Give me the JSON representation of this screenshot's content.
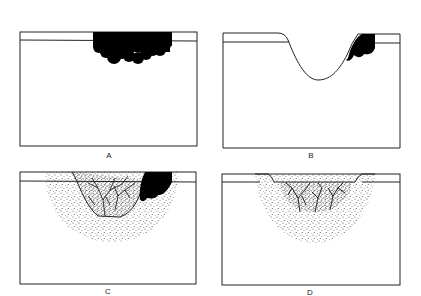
{
  "figure": {
    "panels": [
      {
        "id": "A",
        "label": "A",
        "description": "Flat surface layer with dark blob mass pressing into upper layer"
      },
      {
        "id": "B",
        "label": "B",
        "description": "Crater/depression in surface with dark mass on right slope"
      },
      {
        "id": "C",
        "label": "C",
        "description": "Depression with stippled halo, branching vessel network, dark mass on right"
      },
      {
        "id": "D",
        "label": "D",
        "description": "Shallow depression with stippled halo and branching vessel network"
      }
    ],
    "colors": {
      "line": "#222222",
      "fill_dark": "#000000",
      "background": "#ffffff",
      "stipple": "#333333"
    }
  }
}
